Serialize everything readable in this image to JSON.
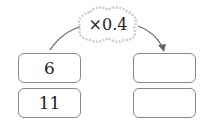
{
  "operation": "×0.4",
  "left_column": [
    "6",
    "11"
  ],
  "right_column": [
    "",
    ""
  ]
}
